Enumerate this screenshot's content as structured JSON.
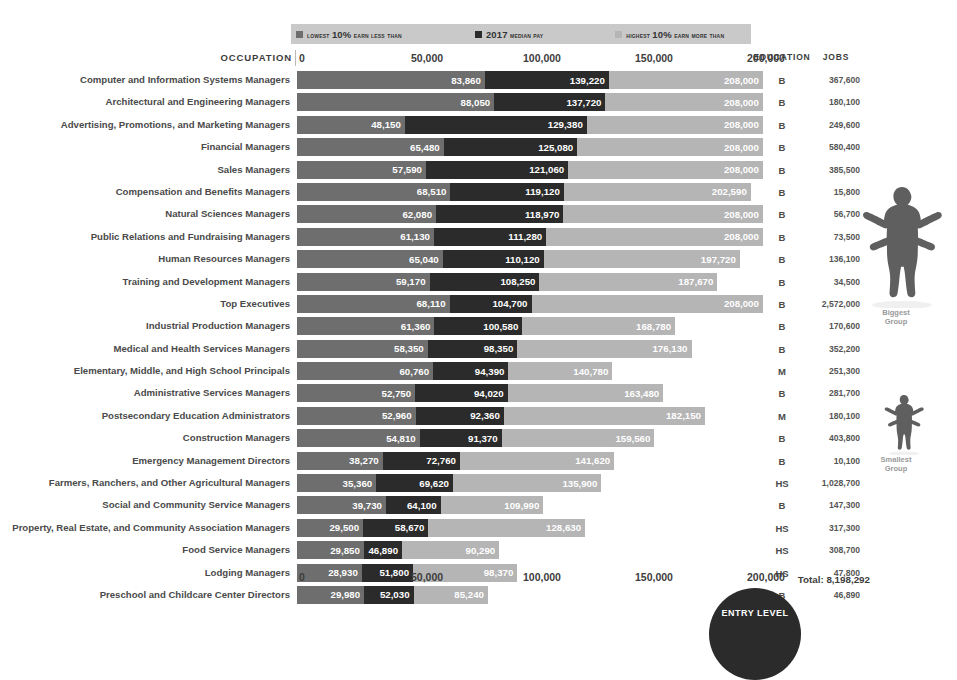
{
  "legend": {
    "items": [
      {
        "swatch_color": "#6e6e6e",
        "prefix": "lowest ",
        "emph": "10%",
        "suffix": " earn less than"
      },
      {
        "swatch_color": "#2b2b2b",
        "prefix": "",
        "emph": "2017",
        "suffix": " median pay"
      },
      {
        "swatch_color": "#b5b5b5",
        "prefix": "highest ",
        "emph": "10%",
        "suffix": " earn more than"
      }
    ]
  },
  "columns": {
    "occupation": "OCCUPATION",
    "education": "EDUCATION",
    "jobs": "JOBS"
  },
  "axis": {
    "ticks": [
      "0",
      "50,000",
      "100,000",
      "150,000",
      "200,000"
    ],
    "tick_values": [
      0,
      50000,
      100000,
      150000,
      200000
    ]
  },
  "annotations": {
    "biggest_group": "Biggest\nGroup",
    "biggest_group_line1": "Biggest",
    "biggest_group_line2": "Group",
    "smallest_group_line1": "Smallest",
    "smallest_group_line2": "Group",
    "entry_level_badge": "ENTRY LEVEL",
    "total_label": "Total: 8,198,292"
  },
  "chart_data": {
    "type": "bar",
    "title": "",
    "xlabel": "",
    "ylabel": "",
    "xlim": [
      0,
      200000
    ],
    "grid": false,
    "legend_position": "top",
    "series": [
      {
        "name": "lowest 10% earn less than",
        "color": "#6e6e6e",
        "values": [
          83860,
          88050,
          48150,
          65480,
          57590,
          68510,
          62080,
          61130,
          65040,
          59170,
          68110,
          61360,
          58350,
          60760,
          52750,
          52960,
          54810,
          38270,
          35360,
          39730,
          29500,
          29850,
          28930,
          29980
        ]
      },
      {
        "name": "2017 median pay",
        "color": "#2b2b2b",
        "values": [
          139220,
          137720,
          129380,
          125080,
          121060,
          119120,
          118970,
          111280,
          110120,
          108250,
          104700,
          100580,
          98350,
          94390,
          94020,
          92360,
          91370,
          72760,
          69620,
          64100,
          58670,
          46890,
          51800,
          52030
        ]
      },
      {
        "name": "highest 10% earn more than",
        "color": "#b5b5b5",
        "values": [
          208000,
          208000,
          208000,
          208000,
          208000,
          202590,
          208000,
          208000,
          197720,
          187670,
          208000,
          168780,
          176130,
          140780,
          163480,
          182150,
          159560,
          141620,
          135900,
          109990,
          128630,
          90290,
          98370,
          85240
        ]
      }
    ],
    "categories": [
      "Computer and Information Systems Managers",
      "Architectural and Engineering Managers",
      "Advertising, Promotions, and Marketing Managers",
      "Financial Managers",
      "Sales Managers",
      "Compensation and Benefits Managers",
      "Natural Sciences Managers",
      "Public Relations and Fundraising Managers",
      "Human Resources Managers",
      "Training and Development Managers",
      "Top Executives",
      "Industrial Production Managers",
      "Medical and Health Services Managers",
      "Elementary, Middle, and High School Principals",
      "Administrative Services Managers",
      "Postsecondary Education Administrators",
      "Construction Managers",
      "Emergency Management Directors",
      "Farmers, Ranchers, and Other Agricultural Managers",
      "Social and Community Service Managers",
      "Property, Real Estate, and Community Association Managers",
      "Food Service Managers",
      "Lodging Managers",
      "Preschool and Childcare Center Directors"
    ],
    "education": [
      "B",
      "B",
      "B",
      "B",
      "B",
      "B",
      "B",
      "B",
      "B",
      "B",
      "B",
      "B",
      "B",
      "M",
      "B",
      "M",
      "B",
      "B",
      "HS",
      "B",
      "HS",
      "HS",
      "HS",
      "B"
    ],
    "jobs": [
      "367,600",
      "180,100",
      "249,600",
      "580,400",
      "385,500",
      "15,800",
      "56,700",
      "73,500",
      "136,100",
      "34,500",
      "2,572,000",
      "170,600",
      "352,200",
      "251,300",
      "281,700",
      "180,100",
      "403,800",
      "10,100",
      "1,028,700",
      "147,300",
      "317,300",
      "308,700",
      "47,800",
      "46,890"
    ],
    "value_labels": {
      "low": [
        "83,860",
        "88,050",
        "48,150",
        "65,480",
        "57,590",
        "68,510",
        "62,080",
        "61,130",
        "65,040",
        "59,170",
        "68,110",
        "61,360",
        "58,350",
        "60,760",
        "52,750",
        "52,960",
        "54,810",
        "38,270",
        "35,360",
        "39,730",
        "29,500",
        "29,850",
        "28,930",
        "29,980"
      ],
      "med": [
        "139,220",
        "137,720",
        "129,380",
        "125,080",
        "121,060",
        "119,120",
        "118,970",
        "111,280",
        "110,120",
        "108,250",
        "104,700",
        "100,580",
        "98,350",
        "94,390",
        "94,020",
        "92,360",
        "91,370",
        "72,760",
        "69,620",
        "64,100",
        "58,670",
        "46,890",
        "51,800",
        "52,030"
      ],
      "high": [
        "208,000",
        "208,000",
        "208,000",
        "208,000",
        "208,000",
        "202,590",
        "208,000",
        "208,000",
        "197,720",
        "187,670",
        "208,000",
        "168,780",
        "176,130",
        "140,780",
        "163,480",
        "182,150",
        "159,560",
        "141,620",
        "135,900",
        "109,990",
        "128,630",
        "90,290",
        "98,370",
        "85,240"
      ]
    }
  },
  "colors": {
    "low": "#6e6e6e",
    "med": "#2b2b2b",
    "high": "#b5b5b5",
    "legend_bg": "#c9c9c9",
    "text": "#3d3d3d"
  }
}
